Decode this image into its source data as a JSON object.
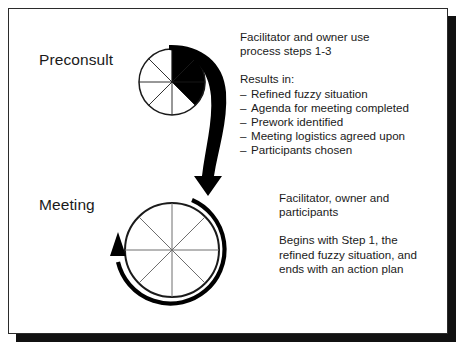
{
  "figure": {
    "background_color": "#ffffff",
    "ink_color": "#1a1a1a",
    "frame_shadow_color": "#111111"
  },
  "stages": [
    {
      "id": "preconsult",
      "label": "Preconsult",
      "wheel": {
        "segments": 8,
        "filled_segments": 3,
        "fill_color": "#000000",
        "center_x": 172,
        "center_y": 82,
        "radius": 33
      }
    },
    {
      "id": "meeting",
      "label": "Meeting",
      "wheel": {
        "segments": 8,
        "filled_segments": 0,
        "fill_color": "#000000",
        "center_x": 172,
        "center_y": 250,
        "radius": 47
      }
    }
  ],
  "preconsult_text": {
    "intro_line_1": "Facilitator and owner use",
    "intro_line_2": "process steps 1-3",
    "results_heading": "Results in:",
    "dash": "–",
    "results": [
      "Refined fuzzy situation",
      "Agenda for meeting completed",
      "Prework identified",
      "Meeting logistics agreed upon",
      "Participants chosen"
    ]
  },
  "meeting_text": {
    "participants_line_1": "Facilitator, owner and",
    "participants_line_2": "participants",
    "description_line_1": "Begins with Step 1, the",
    "description_line_2": "refined fuzzy situation, and",
    "description_line_3": "ends with an action plan"
  },
  "arrows": {
    "preconsult_to_meeting": "curved-swoosh-arrow-down",
    "meeting_cycle": "clockwise-circular-arrow"
  }
}
